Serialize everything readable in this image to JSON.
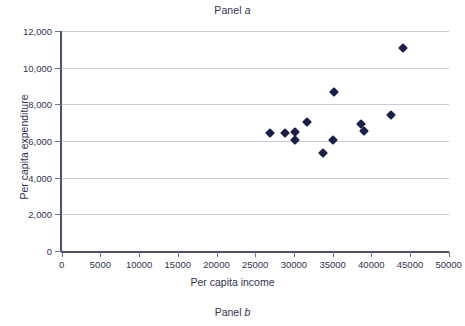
{
  "figure": {
    "panel_title_prefix": "Panel ",
    "panel_title_letter": "a",
    "panel_caption_prefix": "Panel ",
    "panel_caption_letter": "b"
  },
  "chart_data": {
    "type": "scatter",
    "title": "Panel a",
    "xlabel": "Per capita income",
    "ylabel": "Per capita expenditure",
    "xlim": [
      0,
      50000
    ],
    "ylim": [
      0,
      12000
    ],
    "xticks": [
      0,
      5000,
      10000,
      15000,
      20000,
      25000,
      30000,
      35000,
      40000,
      45000,
      50000
    ],
    "xticklabels": [
      "0",
      "5000",
      "10000",
      "15000",
      "20000",
      "25000",
      "30000",
      "35000",
      "40000",
      "45000",
      "50000"
    ],
    "yticks": [
      0,
      2000,
      4000,
      6000,
      8000,
      10000,
      12000
    ],
    "yticklabels": [
      "0",
      "2,000",
      "4,000",
      "6,000",
      "8,000",
      "10,000",
      "12,000"
    ],
    "grid": "horizontal",
    "legend": "none",
    "marker": "diamond",
    "marker_color": "#1b1f47",
    "points": [
      {
        "x": 26900,
        "y": 6450
      },
      {
        "x": 28800,
        "y": 6450
      },
      {
        "x": 30100,
        "y": 6050
      },
      {
        "x": 30200,
        "y": 6500
      },
      {
        "x": 31700,
        "y": 7050
      },
      {
        "x": 33700,
        "y": 5350
      },
      {
        "x": 35100,
        "y": 6050
      },
      {
        "x": 35200,
        "y": 8700
      },
      {
        "x": 38700,
        "y": 6950
      },
      {
        "x": 39000,
        "y": 6550
      },
      {
        "x": 42500,
        "y": 7400
      },
      {
        "x": 44100,
        "y": 11050
      }
    ]
  }
}
